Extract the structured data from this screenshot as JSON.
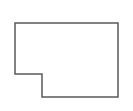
{
  "diagram": {
    "shape": "L-shaped floor outline",
    "stroke_color": "#5a5a5a",
    "fill_color": "#ffffff",
    "stroke_width": 1.5,
    "points": "15,23 118,23 118,97 42,97 42,74 15,74"
  }
}
